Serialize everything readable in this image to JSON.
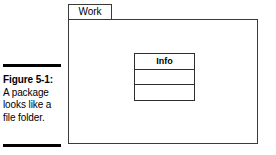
{
  "figure": {
    "caption": {
      "label": "Figure 5-1:",
      "lines": [
        "A package",
        "looks like a",
        "file folder."
      ]
    },
    "package": {
      "tab_label": "Work"
    },
    "class_box": {
      "title": "Info",
      "compartments": [
        "",
        ""
      ]
    },
    "colors": {
      "background": "#ffffff",
      "stroke": "#3a3a3a",
      "rule": "#000000",
      "text": "#000000"
    }
  }
}
